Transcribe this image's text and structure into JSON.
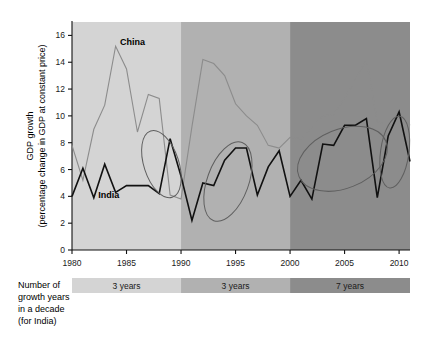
{
  "chart_data": {
    "type": "line",
    "title": "",
    "xlabel": "",
    "ylabel": "GDP growth",
    "ylabel_line1": "GDP growth",
    "ylabel_line2": "(percentage change in GDP at constant price)",
    "xlim": [
      1980,
      2011
    ],
    "ylim": [
      0,
      17
    ],
    "yticks": [
      0,
      2,
      4,
      6,
      8,
      10,
      12,
      14,
      16
    ],
    "ytick_labels": [
      "0",
      "2",
      "4",
      "6",
      "8",
      "10",
      "12",
      "14",
      "16"
    ],
    "xticks": [
      1980,
      1985,
      1990,
      1995,
      2000,
      2005,
      2010
    ],
    "xtick_labels": [
      "1980",
      "1985",
      "1990",
      "1995",
      "2000",
      "2005",
      "2010"
    ],
    "grid": false,
    "legend_position": "inline-annotation",
    "x": [
      1980,
      1981,
      1982,
      1983,
      1984,
      1985,
      1986,
      1987,
      1988,
      1989,
      1990,
      1991,
      1992,
      1993,
      1994,
      1995,
      1996,
      1997,
      1998,
      1999,
      2000,
      2001,
      2002,
      2003,
      2004,
      2005,
      2006,
      2007,
      2008,
      2009,
      2010,
      2011
    ],
    "series": [
      {
        "name": "China",
        "color": "#8c8c8c",
        "values": [
          7.8,
          5.2,
          9.0,
          10.8,
          15.2,
          13.5,
          8.8,
          11.6,
          11.3,
          4.1,
          3.8,
          9.2,
          14.2,
          13.9,
          13.0,
          10.9,
          10.0,
          9.3,
          7.8,
          7.6,
          8.4,
          8.3,
          9.1,
          10.0,
          10.1,
          11.3,
          12.7,
          14.2,
          9.6,
          9.2,
          10.4,
          9.3
        ]
      },
      {
        "name": "India",
        "color": "#111111",
        "values": [
          4.0,
          6.1,
          3.9,
          6.4,
          4.3,
          4.8,
          4.8,
          4.8,
          4.2,
          8.3,
          5.5,
          2.2,
          5.0,
          4.8,
          6.7,
          7.6,
          7.6,
          4.1,
          6.2,
          7.4,
          4.0,
          5.2,
          3.8,
          7.9,
          7.8,
          9.3,
          9.3,
          9.8,
          3.9,
          8.5,
          10.3,
          6.6
        ]
      }
    ],
    "annotations": [
      {
        "name": "china-series-label",
        "text": "China",
        "x": 1984.4,
        "y": 15.3
      },
      {
        "name": "india-series-label",
        "text": "India",
        "x": 1982.4,
        "y": 3.9
      }
    ],
    "highlight_ellipses": [
      {
        "name": "ellipse-1980s",
        "cx": 1988.2,
        "cy": 6.4,
        "rx": 1.6,
        "ry": 2.6,
        "angle": -18
      },
      {
        "name": "ellipse-1990s",
        "cx": 1994.3,
        "cy": 5.1,
        "rx": 1.9,
        "ry": 3.1,
        "angle": 20
      },
      {
        "name": "ellipse-2000s-a",
        "cx": 2004.8,
        "cy": 6.8,
        "rx": 4.3,
        "ry": 2.2,
        "angle": -22
      },
      {
        "name": "ellipse-2000s-b",
        "cx": 2009.6,
        "cy": 7.3,
        "rx": 1.3,
        "ry": 2.7,
        "angle": 8
      }
    ],
    "decade_bands": [
      {
        "name": "band-1980s",
        "start": 1980,
        "end": 1990,
        "color": "#d4d4d4"
      },
      {
        "name": "band-1990s",
        "start": 1990,
        "end": 2000,
        "color": "#b1b1b1"
      },
      {
        "name": "band-2000s",
        "start": 2000,
        "end": 2011,
        "color": "#8c8c8c"
      }
    ]
  },
  "legend": {
    "caption_line1": "Number of",
    "caption_line2": "growth years",
    "caption_line3": "in a decade",
    "caption_line4": "(for India)",
    "bands": [
      {
        "label": "3 years",
        "color": "#d4d4d4"
      },
      {
        "label": "3 years",
        "color": "#b1b1b1"
      },
      {
        "label": "7 years",
        "color": "#8c8c8c"
      }
    ]
  }
}
